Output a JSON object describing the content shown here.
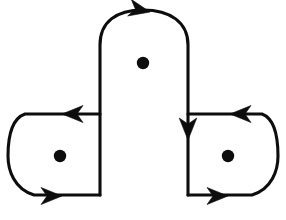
{
  "figure": {
    "title": "Three-loop oriented curve diagram with three punctures",
    "description": "A pair of overlapping oriented simple closed curves on a three-punctured surface: a wide horizontal stadium-shaped loop enclosing the left and right punctures, and a tall arch-shaped loop enclosing the top puncture.",
    "background_color": "#ffffff",
    "ink_color": "#0d0d0d",
    "stroke_width": 3.1,
    "canvas": {
      "width": 286,
      "height": 220
    }
  },
  "punctures": [
    {
      "name": "top-puncture",
      "label": "top",
      "cx": 143,
      "cy": 63,
      "r": 6.2
    },
    {
      "name": "left-puncture",
      "label": "left",
      "cx": 60,
      "cy": 156,
      "r": 6.2
    },
    {
      "name": "right-puncture",
      "label": "right",
      "cx": 228,
      "cy": 156,
      "r": 6.2
    }
  ],
  "curves": [
    {
      "name": "horizontal-stadium-loop",
      "label": "Horizontal loop",
      "orientation": "clockwise",
      "encloses": [
        "left-puncture",
        "right-puncture"
      ],
      "path": "M 100 114 L 25 114 C 8 120 8 148 8 156 C 8 170 14 189 34 195 L 100 195"
    },
    {
      "name": "horizontal-stadium-loop-right",
      "label": "Horizontal loop right arc",
      "orientation": "clockwise",
      "encloses": [
        "right-puncture"
      ],
      "path": "M 188 114 L 262 114 C 278 120 278 148 278 156 C 278 170 272 189 252 195 L 188 195"
    },
    {
      "name": "arch-loop",
      "label": "Arch loop",
      "orientation": "clockwise",
      "encloses": [
        "top-puncture"
      ],
      "path": "M 100 195 L 100 45 C 100 22 116 10 143 10 C 170 10 188 22 188 45 L 188 195"
    }
  ],
  "arrows": [
    {
      "name": "arrow-top-arch",
      "direction": "right",
      "x": 150,
      "y": 12,
      "rotation": 12,
      "on_curve": "arch-loop"
    },
    {
      "name": "arrow-top-left-segment",
      "direction": "left",
      "x": 62,
      "y": 114,
      "rotation": 180,
      "on_curve": "horizontal-stadium-loop"
    },
    {
      "name": "arrow-top-right-segment",
      "direction": "left",
      "x": 230,
      "y": 114,
      "rotation": 180,
      "on_curve": "horizontal-stadium-loop-right"
    },
    {
      "name": "arrow-right-vertical-down",
      "direction": "down",
      "x": 188,
      "y": 140,
      "rotation": 90,
      "on_curve": "arch-loop"
    },
    {
      "name": "arrow-bottom-left-segment",
      "direction": "right",
      "x": 62,
      "y": 196,
      "rotation": 0,
      "on_curve": "horizontal-stadium-loop"
    },
    {
      "name": "arrow-bottom-right-segment",
      "direction": "right",
      "x": 228,
      "y": 196,
      "rotation": 0,
      "on_curve": "horizontal-stadium-loop-right"
    }
  ],
  "crossings": [
    {
      "name": "crossing-left",
      "x": 100,
      "y": 114
    },
    {
      "name": "crossing-right",
      "x": 188,
      "y": 114
    },
    {
      "name": "crossing-bottom-left",
      "x": 100,
      "y": 195
    },
    {
      "name": "crossing-bottom-right",
      "x": 188,
      "y": 195
    }
  ]
}
